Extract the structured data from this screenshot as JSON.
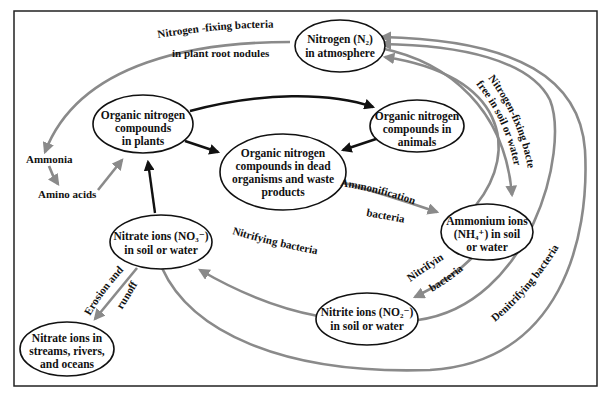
{
  "colors": {
    "frame": "#222222",
    "node_border": "#111111",
    "gray_arrow": "#8a8a8a",
    "black_arrow": "#111111",
    "background": "#ffffff"
  },
  "nodes": {
    "atmosphere": {
      "lines": [
        "Nitrogen (N₂)",
        "in atmosphere"
      ]
    },
    "plants": {
      "lines": [
        "Organic nitrogen",
        "compounds",
        "in plants"
      ]
    },
    "animals": {
      "lines": [
        "Organic nitrogen",
        "compounds in",
        "animals"
      ]
    },
    "dead": {
      "lines": [
        "Organic nitrogen",
        "compounds in dead",
        "organisms and waste",
        "products"
      ]
    },
    "ammonium": {
      "lines": [
        "Ammonium ions",
        "(NH₄⁺) in soil",
        "or water"
      ]
    },
    "nitrite": {
      "lines": [
        "Nitrite ions (NO₂⁻)",
        "in soil or water"
      ]
    },
    "nitrate": {
      "lines": [
        "Nitrate ions (NO₃⁻)",
        "in soil or water"
      ]
    },
    "streams": {
      "lines": [
        "Nitrate ions in",
        "streams, rivers,",
        "and oceans"
      ]
    }
  },
  "free_labels": {
    "ammonia": "Ammonia",
    "amino_acids": "Amino acids"
  },
  "edge_labels": {
    "root_nodules_1": "Nitrogen -fixing  bacteria",
    "root_nodules_2": "in plant root nodules",
    "free_fixing_1": "Nitrogen-fixing bacteria",
    "free_fixing_2": "free in soil or water",
    "ammonification_1": "Ammonification",
    "ammonification_2": "bacteria",
    "nitrifying_a_1": "Nitrifying",
    "nitrifying_a_2": "bacteria",
    "nitrifying_b": "Nitrifying  bacteria",
    "erosion_1": "Erosion and",
    "erosion_2": "runoff",
    "denitrifying": "Denitrifying bacteria"
  }
}
